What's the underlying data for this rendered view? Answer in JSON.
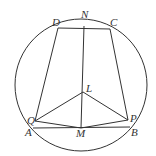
{
  "diagram": {
    "type": "geometry",
    "stroke_color": "#333333",
    "background": "#ffffff",
    "circle": {
      "cx": 81,
      "cy": 85,
      "r": 66
    },
    "points": {
      "D": {
        "x": 58,
        "y": 28,
        "label": "D",
        "lx": 52,
        "ly": 26
      },
      "N": {
        "x": 84,
        "y": 26,
        "label": "N",
        "lx": 81,
        "ly": 18
      },
      "C": {
        "x": 110,
        "y": 29,
        "label": "C",
        "lx": 110,
        "ly": 26
      },
      "L": {
        "x": 83,
        "y": 92,
        "label": "L",
        "lx": 86,
        "ly": 92
      },
      "Q": {
        "x": 35,
        "y": 121,
        "label": "Q",
        "lx": 27,
        "ly": 124
      },
      "P": {
        "x": 128,
        "y": 120,
        "label": "P",
        "lx": 130,
        "ly": 122
      },
      "A": {
        "x": 33,
        "y": 128,
        "label": "A",
        "lx": 25,
        "ly": 136
      },
      "M": {
        "x": 81,
        "y": 128,
        "label": "M",
        "lx": 76,
        "ly": 137
      },
      "B": {
        "x": 130,
        "y": 127,
        "label": "B",
        "lx": 131,
        "ly": 136
      }
    },
    "segments": [
      [
        "D",
        "C"
      ],
      [
        "D",
        "Q"
      ],
      [
        "C",
        "P"
      ],
      [
        "N",
        "M"
      ],
      [
        "L",
        "Q"
      ],
      [
        "L",
        "P"
      ],
      [
        "Q",
        "M"
      ],
      [
        "M",
        "P"
      ],
      [
        "A",
        "B"
      ]
    ]
  }
}
